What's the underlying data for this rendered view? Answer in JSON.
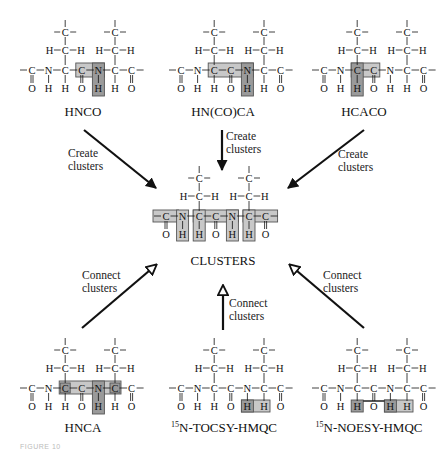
{
  "colors": {
    "ink": "#111111",
    "highlight_fill": "#c8c8c8",
    "highlight_dark": "#9a9a9a",
    "highlight_stroke": "#555555",
    "background": "#ffffff"
  },
  "center": {
    "label": "CLUSTERS"
  },
  "experiments": {
    "top": [
      {
        "name": "HNCO",
        "action": "Create\nclusters",
        "highlight": [
          "C'(i)",
          "N(i+1)",
          "HN(i+1)"
        ]
      },
      {
        "name": "HN(CO)CA",
        "action": "Create\nclusters",
        "highlight": [
          "CA(i)",
          "C'(i)",
          "N(i+1)",
          "HN(i+1)"
        ]
      },
      {
        "name": "HCACO",
        "action": "Create\nclusters",
        "highlight": [
          "HA(i)",
          "CA(i)",
          "C'(i)"
        ]
      }
    ],
    "bottom": [
      {
        "name": "HNCA",
        "action": "Connect\nclusters",
        "highlight": [
          "CA(i)",
          "N(i+1)",
          "HN(i+1)",
          "CA(i+1)"
        ]
      },
      {
        "name_sup": "15",
        "name": "N-TOCSY-HMQC",
        "action": "Connect\nclusters",
        "highlight": [
          "HN(i+1)",
          "HA(i+1)"
        ]
      },
      {
        "name_sup": "15",
        "name": "N-NOESY-HMQC",
        "action": "Connect\nclusters",
        "highlight": [
          "HA(i)",
          "HN(i+1)",
          "HA(i+1)"
        ]
      }
    ]
  },
  "arrows": {
    "create_style": "solid-head",
    "connect_style": "open-head"
  },
  "atoms": {
    "backbone": [
      "C",
      "N",
      "C",
      "C",
      "N",
      "C",
      "C"
    ],
    "below": [
      "O",
      "H",
      "H",
      "O",
      "H",
      "H",
      "O"
    ],
    "side_methylene": [
      "H",
      "C",
      "H"
    ],
    "side_top": "C"
  },
  "figure_caption": "FIGURE 10"
}
